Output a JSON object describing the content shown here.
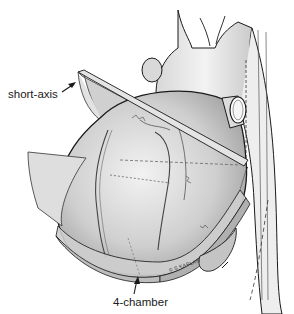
{
  "figure": {
    "labels": {
      "short_axis": "short-axis",
      "four_chamber": "4-chamber"
    },
    "signature": "© S KAPLAN",
    "colors": {
      "background": "#ffffff",
      "line": "#1a1a1a",
      "tissue_light": "#e6e6e6",
      "tissue_mid": "#bdbdbd",
      "plane_fill": "#d4d4d4"
    }
  }
}
